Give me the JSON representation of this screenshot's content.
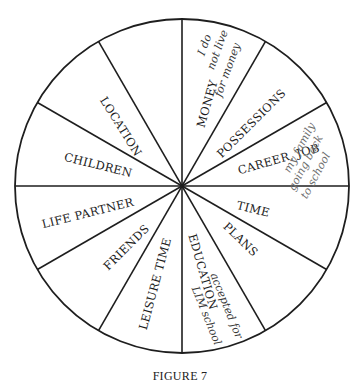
{
  "figure": {
    "caption": "FIGURE 7",
    "wheel": {
      "cx": 182,
      "cy": 186,
      "r": 167,
      "segments": 12,
      "stroke": "#1e1e1e"
    }
  },
  "segments": [
    {
      "label": "LOCATION",
      "x": 120,
      "y": 127,
      "rotate": 58
    },
    {
      "label": "CHILDREN",
      "x": 98,
      "y": 166,
      "rotate": 14
    },
    {
      "label": "LIFE PARTNER",
      "x": 88,
      "y": 214,
      "rotate": -14
    },
    {
      "label": "FRIENDS",
      "x": 127,
      "y": 248,
      "rotate": -45
    },
    {
      "label": "LEISURE TIME",
      "x": 156,
      "y": 284,
      "rotate": -75
    },
    {
      "label": "EDUCATION",
      "x": 202,
      "y": 272,
      "rotate": 74
    },
    {
      "label": "PLANS",
      "x": 240,
      "y": 240,
      "rotate": 44
    },
    {
      "label": "TIME",
      "x": 253,
      "y": 210,
      "rotate": 14
    },
    {
      "label": "CAREER, JOB",
      "x": 279,
      "y": 160,
      "rotate": -16
    },
    {
      "label": "POSSESSIONS",
      "x": 252,
      "y": 124,
      "rotate": -45
    },
    {
      "label": "MONEY",
      "x": 208,
      "y": 104,
      "rotate": -74
    },
    {
      "label": "",
      "x": 0,
      "y": 0,
      "rotate": 0
    }
  ],
  "handwritten_notes": [
    {
      "segment": "MONEY",
      "lines": [
        "I do",
        "not live",
        "for money"
      ],
      "x": [
        205,
        218,
        228
      ],
      "y": [
        45,
        50,
        70
      ],
      "rotate": -70,
      "tone": "dark"
    },
    {
      "segment": "CAREER, JOB",
      "lines": [
        "my family",
        "going back",
        "to school"
      ],
      "x": [
        300,
        306,
        316
      ],
      "y": [
        148,
        163,
        176
      ],
      "rotate": -62,
      "tone": "gray"
    },
    {
      "segment": "EDUCATION",
      "lines": [
        "accepted for",
        "LIM school"
      ],
      "x": [
        226,
        206
      ],
      "y": [
        306,
        316
      ],
      "rotate": 68,
      "tone": "dark"
    }
  ]
}
